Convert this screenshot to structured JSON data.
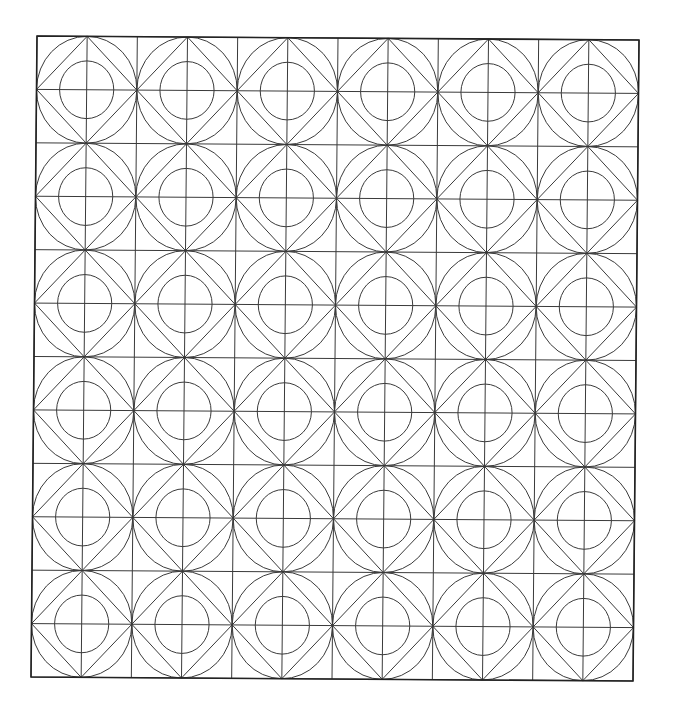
{
  "page": {
    "title": "",
    "background": "#ffffff",
    "line_color": "#3a3a3a",
    "frame_color": "#222222"
  },
  "pattern": {
    "type": "tiled geometric line-art (coloring page)",
    "rows": 6,
    "cols": 6,
    "corners": {
      "top_left": [
        37,
        36
      ],
      "top_right": [
        639,
        40
      ],
      "bottom_left": [
        31,
        677
      ],
      "bottom_right": [
        633,
        682
      ]
    },
    "tile_motif": [
      "square tile split into 2x2 sub-cells by vertical and horizontal center lines",
      "outer circle inscribed in the tile (touching edge midpoints)",
      "diamond connecting the four edge midpoints",
      "inner circle centered in tile, radius ~0.27 of tile width"
    ],
    "inner_circle_ratio": 0.27
  }
}
